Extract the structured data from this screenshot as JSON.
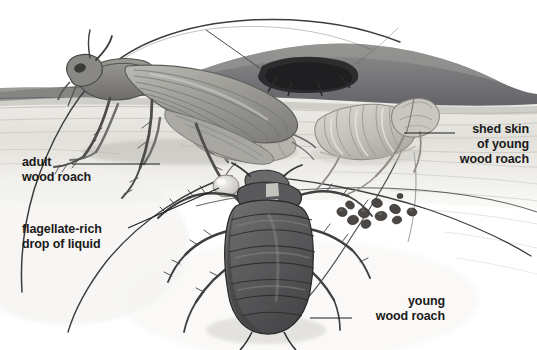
{
  "figure": {
    "medium": "graphite pencil scientific illustration",
    "palette": {
      "paper": "#ffffff",
      "ink": "#1a1a1a",
      "leader_line": "#2b2b2b",
      "log_dark": "#7a7a78",
      "log_darker": "#56565a",
      "burrow_black": "#2a2a2c",
      "wood_pale": "#e9e8e4",
      "wood_grain": "#c9c7c1",
      "adult_body": "#8d8d8a",
      "adult_wing": "#a2a19d",
      "nymph_body": "#5e5e5f",
      "nymph_dark": "#4a4a4c",
      "shed_skin": "#c3c1ba",
      "frass": "#4a4744"
    },
    "labels": [
      {
        "name": "adult-wood-roach",
        "lines": [
          "adult",
          "wood roach"
        ],
        "align": "left",
        "x": 22,
        "y": 157,
        "leader": {
          "x1": 72,
          "y1": 164,
          "x2": 160,
          "y2": 164
        }
      },
      {
        "name": "flagellate-rich-drop",
        "lines": [
          "flagellate-rich",
          "drop of liquid"
        ],
        "align": "left",
        "x": 22,
        "y": 224,
        "leader": {
          "x1": 128,
          "y1": 228,
          "x2": 222,
          "y2": 188
        }
      },
      {
        "name": "shed-skin-of-young-wood-roach",
        "lines": [
          "shed skin",
          "of young",
          "wood roach"
        ],
        "align": "right",
        "x": 457,
        "y": 124,
        "leader": {
          "x1": 455,
          "y1": 133,
          "x2": 404,
          "y2": 133
        }
      },
      {
        "name": "young-wood-roach",
        "lines": [
          "young",
          "wood roach"
        ],
        "align": "right",
        "x": 443,
        "y": 296,
        "leader": {
          "x1": 352,
          "y1": 318,
          "x2": 310,
          "y2": 318
        }
      }
    ],
    "subjects": [
      {
        "name": "adult-wood-roach",
        "stage": "adult",
        "features": "winged, long antennae, side view, standing on pale wood surface"
      },
      {
        "name": "young-wood-roach",
        "stage": "nymph",
        "features": "wingless, dark segmented abdomen, dorsal view, lower centre"
      },
      {
        "name": "shed-skin",
        "stage": "exuvia",
        "features": "pale translucent molted cuticle of a nymph, right of centre"
      },
      {
        "name": "roach-in-burrow",
        "stage": "adult",
        "features": "dark silhouette inside gallery in rotting log, upper centre"
      },
      {
        "name": "frass-pellets",
        "count": 11,
        "features": "small dark droppings scattered right of the nymph"
      }
    ],
    "background": {
      "name": "rotting-log-cross-section",
      "elements": [
        "dark bark band across upper third",
        "pale wood interior with horizontal grain",
        "burrow cavity"
      ]
    }
  }
}
